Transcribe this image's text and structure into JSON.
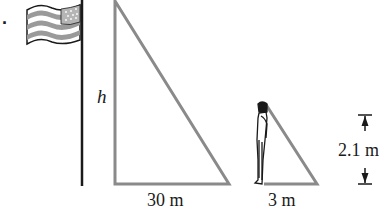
{
  "problem_marker": ".",
  "labels": {
    "flagpole_height": "h",
    "flagpole_shadow": "30 m",
    "person_shadow": "3 m",
    "person_height": "2.1 m"
  },
  "figure": {
    "flag": "american-flag",
    "person": "standing-person",
    "colors": {
      "line_gray": "#8a8a8a",
      "ink": "#1a1a1a",
      "flag_stripe": "#9a9a9a",
      "canton": "#b5b5b5"
    }
  }
}
